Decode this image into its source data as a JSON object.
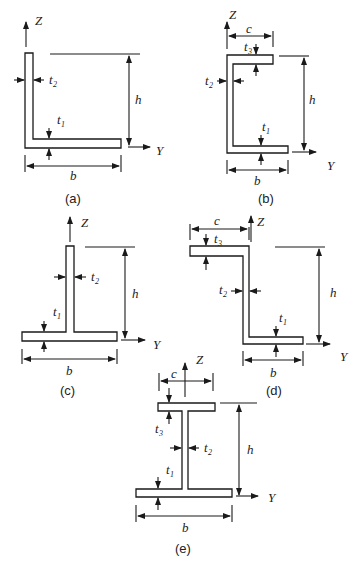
{
  "figure": {
    "panels": [
      {
        "id": "a",
        "caption": "(a)",
        "shape": "L-section (angle)",
        "axis_z": "Z",
        "axis_y": "Y",
        "height": "h",
        "width": "b",
        "t1": "t",
        "t1_sub": "1",
        "t2": "t",
        "t2_sub": "2"
      },
      {
        "id": "b",
        "caption": "(b)",
        "shape": "C-section (channel, unequal flanges)",
        "axis_z": "Z",
        "axis_y": "Y",
        "height": "h",
        "width": "b",
        "top_width": "c",
        "t1": "t",
        "t1_sub": "1",
        "t2": "t",
        "t2_sub": "2",
        "t3": "t",
        "t3_sub": "3"
      },
      {
        "id": "c",
        "caption": "(c)",
        "shape": "T-section",
        "axis_z": "Z",
        "axis_y": "Y",
        "height": "h",
        "width": "b",
        "t1": "t",
        "t1_sub": "1",
        "t2": "t",
        "t2_sub": "2"
      },
      {
        "id": "d",
        "caption": "(d)",
        "shape": "Z-section",
        "axis_z": "Z",
        "axis_y": "Y",
        "height": "h",
        "width": "b",
        "top_width": "c",
        "t1": "t",
        "t1_sub": "1",
        "t2": "t",
        "t2_sub": "2",
        "t3": "t",
        "t3_sub": "3"
      },
      {
        "id": "e",
        "caption": "(e)",
        "shape": "I-section (unequal flanges)",
        "axis_z": "Z",
        "axis_y": "Y",
        "height": "h",
        "width": "b",
        "top_width": "c",
        "t1": "t",
        "t1_sub": "1",
        "t2": "t",
        "t2_sub": "2",
        "t3": "t",
        "t3_sub": "3"
      }
    ]
  }
}
